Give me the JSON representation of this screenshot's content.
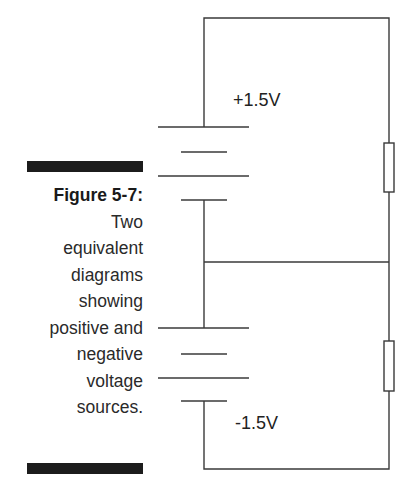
{
  "caption": {
    "figure_label": "Figure 5-7:",
    "lines": [
      "Two",
      "equivalent",
      "diagrams",
      "showing",
      "positive and",
      "negative",
      "voltage",
      "sources."
    ]
  },
  "circuit": {
    "top_voltage_label": "+1.5V",
    "bottom_voltage_label": "-1.5V",
    "components": [
      "battery-top",
      "battery-bottom",
      "resistor-top",
      "resistor-bottom"
    ],
    "line_color": "#3a3a3a"
  }
}
